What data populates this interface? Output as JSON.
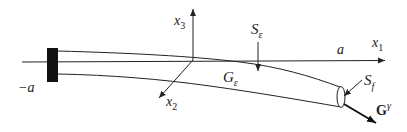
{
  "diagram": {
    "type": "beam-deformation-schematic",
    "labels": {
      "x1_axis": "x",
      "x1_sub": "1",
      "x2_axis": "x",
      "x2_sub": "2",
      "x3_axis": "x",
      "x3_sub": "3",
      "left_end": "−a",
      "right_end": "a",
      "surface_eps": "S",
      "surface_eps_sub": "ε",
      "domain": "G",
      "domain_sub": "ε",
      "end_face": "S",
      "end_face_sub": "f",
      "force": "G",
      "force_sup": "γ"
    },
    "colors": {
      "stroke": "#222222",
      "clamp": "#111111",
      "background": "#ffffff"
    }
  }
}
